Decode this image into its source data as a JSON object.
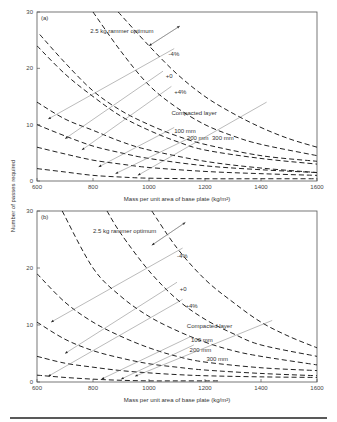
{
  "chart_data": [
    {
      "panel": "(a)",
      "type": "line",
      "xlabel": "Mass per unit area of base plate (kg/m²)",
      "ylabel": "Number of passes required",
      "xlim": [
        600,
        1600
      ],
      "ylim": [
        0,
        30
      ],
      "xticks": [
        "600",
        "800",
        "1000",
        "1200",
        "1400",
        "1600"
      ],
      "yticks": [
        "0",
        "10",
        "20",
        "30"
      ],
      "annotations": {
        "title": "2.5 kg rammer optimum",
        "moisture": [
          "-4%",
          "+0",
          "+4%"
        ],
        "layer_title": "Compacted layer",
        "layers": [
          "100 mm",
          "200 mm",
          "300 mm"
        ]
      },
      "series": [
        {
          "name": "300 mm, -4%",
          "x": [
            890,
            1000,
            1100,
            1200,
            1300,
            1400,
            1500,
            1600
          ],
          "y": [
            30,
            24,
            19,
            15,
            12,
            9.5,
            7.5,
            6
          ]
        },
        {
          "name": "300 mm, +0",
          "x": [
            800,
            900,
            1000,
            1100,
            1200,
            1300,
            1400,
            1600
          ],
          "y": [
            30,
            23,
            17,
            13,
            10,
            8,
            6.5,
            4.5
          ]
        },
        {
          "name": "300 mm, +4%",
          "x": [
            610,
            700,
            800,
            900,
            1000,
            1100,
            1200,
            1400,
            1600
          ],
          "y": [
            26,
            21,
            16,
            12.5,
            10,
            8,
            6.5,
            4.5,
            3.5
          ]
        },
        {
          "name": "200 mm, +0",
          "x": [
            600,
            700,
            800,
            900,
            1000,
            1100,
            1200,
            1400,
            1600
          ],
          "y": [
            24,
            19,
            15,
            11.5,
            9,
            7,
            5.5,
            4,
            3
          ]
        },
        {
          "name": "200 mm, +4%",
          "x": [
            600,
            700,
            800,
            900,
            1000,
            1200,
            1400,
            1600
          ],
          "y": [
            14,
            11,
            9,
            7,
            5.5,
            3.5,
            2.3,
            1.5
          ]
        },
        {
          "name": "100 mm, -4%",
          "x": [
            600,
            700,
            800,
            900,
            1000,
            1200,
            1400,
            1600
          ],
          "y": [
            10,
            8,
            6.2,
            5,
            4,
            2.7,
            2,
            1.5
          ]
        },
        {
          "name": "100 mm, +0",
          "x": [
            600,
            700,
            800,
            900,
            1000,
            1200,
            1400,
            1600
          ],
          "y": [
            6,
            4.8,
            3.7,
            3,
            2.4,
            1.7,
            1.3,
            1
          ]
        },
        {
          "name": "100 mm, +4%",
          "x": [
            600,
            700,
            800,
            900,
            1000,
            1200,
            1400,
            1600
          ],
          "y": [
            2.2,
            1.6,
            1,
            0.7,
            0.5,
            0.4,
            0.4,
            0.4
          ]
        }
      ]
    },
    {
      "panel": "(b)",
      "type": "line",
      "xlabel": "Mass per unit area of base plate (kg/m²)",
      "ylabel": "Number of passes required",
      "xlim": [
        600,
        1600
      ],
      "ylim": [
        0,
        30
      ],
      "xticks": [
        "600",
        "800",
        "1000",
        "1200",
        "1400",
        "1600"
      ],
      "yticks": [
        "0",
        "10",
        "20",
        "30"
      ],
      "annotations": {
        "title": "2.5 kg rammer optimum",
        "moisture": [
          "-4%",
          "+0",
          "+4%"
        ],
        "layer_title": "Compacted layer",
        "layers": [
          "100 mm",
          "200 mm",
          "300 mm"
        ]
      },
      "series": [
        {
          "name": "300 mm, -4%",
          "x": [
            1010,
            1100,
            1200,
            1300,
            1400,
            1500,
            1600
          ],
          "y": [
            30,
            23.5,
            18,
            14,
            10.5,
            8,
            6
          ]
        },
        {
          "name": "300 mm, +0",
          "x": [
            850,
            900,
            1000,
            1100,
            1200,
            1300,
            1400,
            1600
          ],
          "y": [
            30,
            26,
            19.5,
            14.5,
            11,
            8.5,
            6.5,
            4.5
          ]
        },
        {
          "name": "200 mm, -4%",
          "x": [
            690,
            800,
            900,
            1000,
            1100,
            1200,
            1300,
            1400,
            1600
          ],
          "y": [
            30,
            20,
            15,
            11.5,
            9,
            7,
            5.5,
            4.5,
            3
          ]
        },
        {
          "name": "200 mm, +0",
          "x": [
            600,
            700,
            800,
            900,
            1000,
            1100,
            1200,
            1400,
            1600
          ],
          "y": [
            19,
            14,
            10.5,
            8,
            6,
            4.5,
            3.5,
            2.5,
            2
          ]
        },
        {
          "name": "100 mm, -4%",
          "x": [
            600,
            700,
            800,
            900,
            1000,
            1100,
            1200,
            1400,
            1600
          ],
          "y": [
            10.5,
            7.5,
            5.5,
            4.2,
            3.2,
            2.6,
            2.1,
            1.5,
            1.1
          ]
        },
        {
          "name": "100 mm, +0",
          "x": [
            600,
            700,
            800,
            900,
            1000,
            1100,
            1200,
            1400,
            1600
          ],
          "y": [
            4.5,
            3.3,
            2.6,
            2,
            1.6,
            1.3,
            1.1,
            0.9,
            0.8
          ]
        },
        {
          "name": "100 mm, +4%",
          "x": [
            600,
            700,
            800,
            900,
            1000,
            1100,
            1200,
            1250
          ],
          "y": [
            1.2,
            0.8,
            0.5,
            0.3,
            0.2,
            0.2,
            0.2,
            0.2
          ]
        }
      ]
    }
  ]
}
